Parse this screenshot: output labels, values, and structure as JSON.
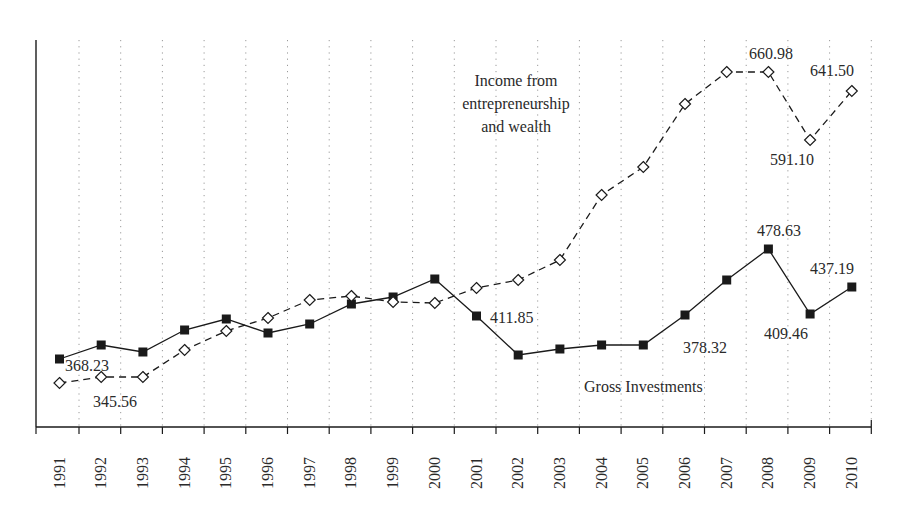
{
  "chart_data": {
    "type": "line",
    "title": "",
    "xlabel": "",
    "ylabel": "",
    "grid": "vertical dotted",
    "legend": "inline series labels",
    "categories": [
      "1991",
      "1992",
      "1993",
      "1994",
      "1995",
      "1996",
      "1997",
      "1998",
      "1999",
      "2000",
      "2001",
      "2002",
      "2003",
      "2004",
      "2005",
      "2006",
      "2007",
      "2008",
      "2009",
      "2010"
    ],
    "series": [
      {
        "name": "Gross Investments",
        "marker": "filled-square",
        "line": "solid",
        "values": [
          368.23,
          382.8,
          375.5,
          398.4,
          409.9,
          395.3,
          404.7,
          425.5,
          432.8,
          451.5,
          413.0,
          372.4,
          378.7,
          382.8,
          382.8,
          414.0,
          450.4,
          478.63,
          409.46,
          437.19
        ],
        "pixel_y": [
          359,
          345,
          352,
          330,
          319,
          333,
          324,
          304,
          297,
          279,
          316,
          355,
          349,
          345,
          345,
          315,
          280,
          249,
          314,
          287
        ],
        "labels": [
          {
            "index": 0,
            "text": "368.23",
            "x": 65,
            "y": 371
          },
          {
            "index": 11,
            "text": "411.85",
            "x": 490,
            "y": 323
          },
          {
            "index": 15,
            "text": "378.32",
            "x": 683,
            "y": 353
          },
          {
            "index": 17,
            "text": "478.63",
            "x": 757,
            "y": 236
          },
          {
            "index": 18,
            "text": "409.46",
            "x": 764,
            "y": 339
          },
          {
            "index": 19,
            "text": "437.19",
            "x": 810,
            "y": 274
          }
        ],
        "title_label": {
          "text": "Gross Investments",
          "x": 584,
          "y": 392
        }
      },
      {
        "name": "Income from entrepreneurship and wealth",
        "marker": "open-diamond",
        "line": "dashed",
        "values": [
          345.0,
          345.56,
          351.8,
          379.9,
          399.6,
          413.2,
          431.9,
          436.0,
          429.8,
          428.8,
          444.4,
          452.7,
          473.5,
          541.1,
          570.2,
          635.7,
          660.98,
          660.98,
          591.1,
          641.5
        ],
        "pixel_y": [
          383,
          377,
          377,
          350,
          331,
          318,
          300,
          296,
          302,
          303,
          288,
          280,
          260,
          195,
          167,
          104,
          72,
          72,
          140,
          91
        ],
        "labels": [
          {
            "index": 1,
            "text": "345.56",
            "x": 93,
            "y": 407
          },
          {
            "index": 17,
            "text": "660.98",
            "x": 749,
            "y": 59
          },
          {
            "index": 18,
            "text": "591.10",
            "x": 770,
            "y": 165
          },
          {
            "index": 19,
            "text": "641.50",
            "x": 810,
            "y": 76
          }
        ],
        "title_label": {
          "lines": [
            "Income from",
            "entrepreneurship",
            "and wealth"
          ],
          "x": 516,
          "y": 86
        }
      }
    ]
  },
  "axes": {
    "x_axis_y": 427,
    "y_axis_x": 36,
    "y_top": 40,
    "x_right": 871,
    "first_tick_x": 79,
    "tick_spacing": 41.7,
    "first_point_x": 59.5
  },
  "colors": {
    "ink": "#1a1a1a",
    "grid": "#9a9a9a",
    "text": "#2a2a2a",
    "background": "#ffffff"
  }
}
